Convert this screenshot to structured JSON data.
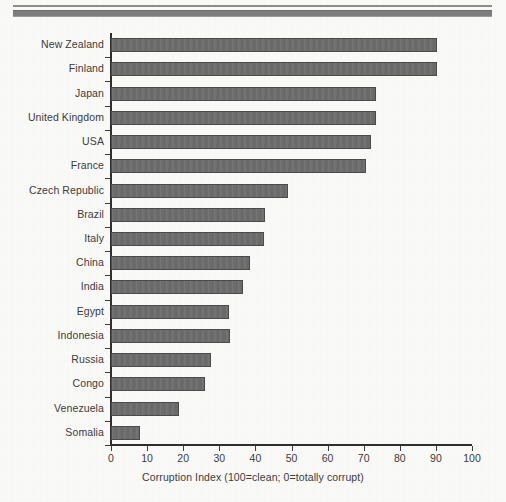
{
  "figure": {
    "width": 506,
    "height": 502,
    "background_color": "#fbfbfa",
    "top_rule": {
      "thin_color": "#8d8d8d",
      "thick_color": "#7d7d7d"
    }
  },
  "chart_data": {
    "type": "bar",
    "orientation": "horizontal",
    "title": "",
    "xlabel": "Corruption Index (100=clean; 0=totally corrupt)",
    "ylabel": "",
    "xlim": [
      0,
      100
    ],
    "xticks": [
      0,
      10,
      20,
      30,
      40,
      50,
      60,
      70,
      80,
      90,
      100
    ],
    "grid": false,
    "legend": false,
    "bar_color": "#6d6d6d",
    "bar_edge_color": "#4a4a4a",
    "axis_color": "#2f2f2f",
    "categories": [
      "New Zealand",
      "Finland",
      "Japan",
      "United Kingdom",
      "USA",
      "France",
      "Czech Republic",
      "Brazil",
      "Italy",
      "China",
      "India",
      "Egypt",
      "Indonesia",
      "Russia",
      "Congo",
      "Venezuela",
      "Somalia"
    ],
    "values": [
      90.3,
      90.3,
      73.5,
      73.5,
      72.0,
      70.5,
      49.0,
      42.7,
      42.4,
      38.5,
      36.6,
      32.7,
      32.9,
      27.7,
      26.0,
      18.8,
      8.0
    ]
  }
}
